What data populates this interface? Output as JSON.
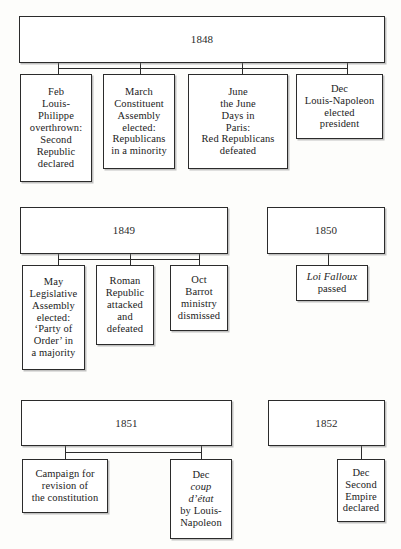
{
  "diagram": {
    "ink_color": "#2b2b2b",
    "paper_color": "#fdfdfb"
  },
  "groups": [
    {
      "id": "group-1848",
      "year": "1848",
      "events": [
        {
          "id": "event-feb-louis-philippe",
          "lines": [
            "Feb",
            "Louis-",
            "Philippe",
            "overthrown:",
            "Second",
            "Republic",
            "declared"
          ],
          "italic_lines": []
        },
        {
          "id": "event-march-constituent-assembly",
          "lines": [
            "March",
            "Constituent",
            "Assembly",
            "elected:",
            "Republicans",
            "in a minority"
          ],
          "italic_lines": []
        },
        {
          "id": "event-june-days",
          "lines": [
            "June",
            "the June",
            "Days in",
            "Paris:",
            "Red Republicans",
            "defeated"
          ],
          "italic_lines": []
        },
        {
          "id": "event-dec-louis-napoleon-president",
          "lines": [
            "Dec",
            "Louis-Napoleon",
            "elected",
            "president"
          ],
          "italic_lines": []
        }
      ]
    },
    {
      "id": "group-1849",
      "year": "1849",
      "events": [
        {
          "id": "event-may-legislative-assembly",
          "lines": [
            "May",
            "Legislative",
            "Assembly",
            "elected:",
            "‘Party of",
            "Order’ in",
            "a majority"
          ],
          "italic_lines": []
        },
        {
          "id": "event-roman-republic",
          "lines": [
            "Roman",
            "Republic",
            "attacked",
            "and",
            "defeated"
          ],
          "italic_lines": []
        },
        {
          "id": "event-oct-barrot-ministry",
          "lines": [
            "Oct",
            "Barrot",
            "ministry",
            "dismissed"
          ],
          "italic_lines": []
        }
      ]
    },
    {
      "id": "group-1850",
      "year": "1850",
      "events": [
        {
          "id": "event-loi-falloux",
          "lines": [
            "Loi Falloux",
            "passed"
          ],
          "italic_lines": [
            0
          ]
        }
      ]
    },
    {
      "id": "group-1851",
      "year": "1851",
      "events": [
        {
          "id": "event-campaign-revision-constitution",
          "lines": [
            "Campaign for",
            "revision of",
            "the constitution"
          ],
          "italic_lines": []
        },
        {
          "id": "event-dec-coup-detat",
          "lines": [
            "Dec",
            "coup",
            "d’état",
            "by Louis-",
            "Napoleon"
          ],
          "italic_lines": [
            1,
            2
          ]
        }
      ]
    },
    {
      "id": "group-1852",
      "year": "1852",
      "events": [
        {
          "id": "event-dec-second-empire",
          "lines": [
            "Dec",
            "Second",
            "Empire",
            "declared"
          ],
          "italic_lines": []
        }
      ]
    }
  ],
  "layout": {
    "year_boxes": [
      {
        "id": "group-1848",
        "x": 19,
        "y": 16,
        "w": 366,
        "h": 47
      },
      {
        "id": "group-1849",
        "x": 20,
        "y": 207,
        "w": 208,
        "h": 47
      },
      {
        "id": "group-1850",
        "x": 267,
        "y": 207,
        "w": 118,
        "h": 47
      },
      {
        "id": "group-1851",
        "x": 21,
        "y": 400,
        "w": 211,
        "h": 46
      },
      {
        "id": "group-1852",
        "x": 268,
        "y": 400,
        "w": 117,
        "h": 46
      }
    ],
    "event_boxes": [
      {
        "id": "event-feb-louis-philippe",
        "x": 20,
        "y": 74,
        "w": 72,
        "h": 108
      },
      {
        "id": "event-march-constituent-assembly",
        "x": 103,
        "y": 74,
        "w": 72,
        "h": 95
      },
      {
        "id": "event-june-days",
        "x": 188,
        "y": 74,
        "w": 100,
        "h": 95
      },
      {
        "id": "event-dec-louis-napoleon-president",
        "x": 296,
        "y": 74,
        "w": 87,
        "h": 65
      },
      {
        "id": "event-may-legislative-assembly",
        "x": 22,
        "y": 265,
        "w": 63,
        "h": 105
      },
      {
        "id": "event-roman-republic",
        "x": 96,
        "y": 265,
        "w": 58,
        "h": 80
      },
      {
        "id": "event-oct-barrot-ministry",
        "x": 170,
        "y": 265,
        "w": 58,
        "h": 66
      },
      {
        "id": "event-loi-falloux",
        "x": 296,
        "y": 265,
        "w": 72,
        "h": 36
      },
      {
        "id": "event-campaign-revision-constitution",
        "x": 22,
        "y": 459,
        "w": 86,
        "h": 54
      },
      {
        "id": "event-dec-coup-detat",
        "x": 170,
        "y": 459,
        "w": 62,
        "h": 80
      },
      {
        "id": "event-dec-second-empire",
        "x": 337,
        "y": 459,
        "w": 48,
        "h": 63
      }
    ],
    "connectors": [
      {
        "id": "conn-1848-bus",
        "type": "h",
        "x": 58,
        "y": 68,
        "len": 289
      },
      {
        "id": "conn-1848-stem-0",
        "type": "v",
        "x": 58,
        "y": 63,
        "len": 11
      },
      {
        "id": "conn-1848-stem-1",
        "type": "v",
        "x": 140,
        "y": 63,
        "len": 11
      },
      {
        "id": "conn-1848-stem-2",
        "type": "v",
        "x": 242,
        "y": 63,
        "len": 11
      },
      {
        "id": "conn-1848-stem-3",
        "type": "v",
        "x": 347,
        "y": 63,
        "len": 11
      },
      {
        "id": "conn-1849-bus",
        "type": "h",
        "x": 58,
        "y": 259,
        "len": 141
      },
      {
        "id": "conn-1849-stem-0",
        "type": "v",
        "x": 58,
        "y": 254,
        "len": 11
      },
      {
        "id": "conn-1849-stem-1",
        "type": "v",
        "x": 130,
        "y": 254,
        "len": 11
      },
      {
        "id": "conn-1849-stem-2",
        "type": "v",
        "x": 199,
        "y": 254,
        "len": 11
      },
      {
        "id": "conn-1850-stem-0",
        "type": "v",
        "x": 328,
        "y": 254,
        "len": 11
      },
      {
        "id": "conn-1851-bus",
        "type": "h",
        "x": 65,
        "y": 452,
        "len": 136
      },
      {
        "id": "conn-1851-stem-0",
        "type": "v",
        "x": 65,
        "y": 446,
        "len": 13
      },
      {
        "id": "conn-1851-stem-1",
        "type": "v",
        "x": 201,
        "y": 446,
        "len": 13
      },
      {
        "id": "conn-1852-stem-0",
        "type": "v",
        "x": 361,
        "y": 446,
        "len": 13
      }
    ]
  }
}
